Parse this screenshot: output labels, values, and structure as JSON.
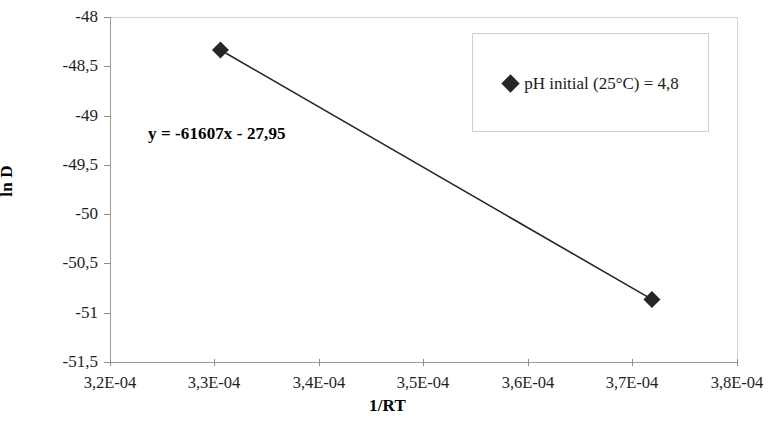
{
  "chart_data": {
    "type": "scatter",
    "title": "",
    "subtitle": "",
    "xlabel": "1/RT",
    "ylabel": "ln D",
    "xlim": [
      0.00032,
      0.00038
    ],
    "ylim": [
      -51.5,
      -48.0
    ],
    "grid": false,
    "legend_position": "top-right",
    "x_tick_labels": [
      "3,2E-04",
      "3,3E-04",
      "3,4E-04",
      "3,5E-04",
      "3,6E-04",
      "3,7E-04",
      "3,8E-04"
    ],
    "x_tick_values": [
      0.00032,
      0.00033,
      0.00034,
      0.00035,
      0.00036,
      0.00037,
      0.00038
    ],
    "y_tick_labels": [
      "-48",
      "-48,5",
      "-49",
      "-49,5",
      "-50",
      "-50,5",
      "-51",
      "-51,5"
    ],
    "y_tick_values": [
      -48,
      -48.5,
      -49,
      -49.5,
      -50,
      -50.5,
      -51,
      -51.5
    ],
    "series": [
      {
        "name": "pH initial (25°C) = 4,8",
        "marker": "diamond",
        "color": "#262626",
        "line": true,
        "x": [
          0.00033057,
          0.00037186
        ],
        "y": [
          -48.335,
          -50.865
        ],
        "points": [
          {
            "x": 0.00033057,
            "y": -48.335
          },
          {
            "x": 0.00037186,
            "y": -50.865
          }
        ]
      }
    ],
    "annotations": [
      {
        "name": "trendline-equation",
        "text": "y = -61607x - 27,95",
        "slope": -61607,
        "intercept": -27.95
      }
    ]
  },
  "axes": {
    "y_title": "ln D",
    "x_title": "1/RT"
  },
  "legend": {
    "entries": [
      {
        "label": "pH initial (25°C) = 4,8",
        "marker_icon": "diamond-marker-icon",
        "color": "#262626"
      }
    ]
  },
  "annotation": {
    "equation": "y = -61607x - 27,95"
  },
  "colors": {
    "marker": "#262626",
    "line": "#262626",
    "axis": "#9a9a9a",
    "frame": "#d2d2d2",
    "text": "#1a1a1a",
    "background": "#ffffff"
  }
}
